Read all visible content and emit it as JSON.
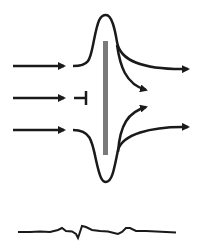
{
  "diagram": {
    "colors": {
      "stroke": "#1a1a1a",
      "barrier": "#7a7a7a",
      "background": "#ffffff"
    },
    "inputs": [
      {
        "id": "input-top",
        "type": "arrow"
      },
      {
        "id": "input-middle",
        "type": "arrow-blocked"
      },
      {
        "id": "input-bottom",
        "type": "arrow"
      }
    ],
    "outputs": [
      {
        "id": "output-top-far",
        "type": "arrow"
      },
      {
        "id": "output-top-near",
        "type": "arrow"
      },
      {
        "id": "output-bottom-near",
        "type": "arrow"
      },
      {
        "id": "output-bottom-far",
        "type": "arrow"
      }
    ],
    "trace": {
      "id": "recording-trace",
      "type": "waveform"
    }
  }
}
